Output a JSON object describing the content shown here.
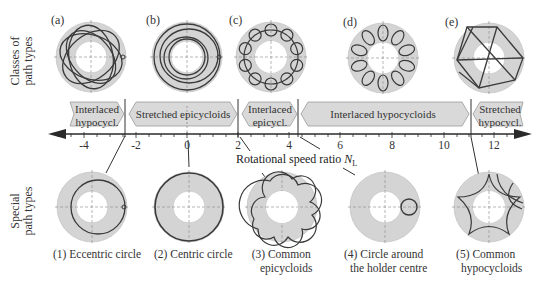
{
  "row_labels": {
    "classes": "Classes of\npath types",
    "classes_line1": "Classes of",
    "classes_line2": "path types",
    "special_line1": "Special",
    "special_line2": "path types"
  },
  "classes": [
    {
      "letter": "(a)",
      "type": "interlaced-hypocycloid"
    },
    {
      "letter": "(b)",
      "type": "stretched-epicycloid"
    },
    {
      "letter": "(c)",
      "type": "interlaced-epicycloid"
    },
    {
      "letter": "(d)",
      "type": "interlaced-hypocycloid"
    },
    {
      "letter": "(e)",
      "type": "stretched-hypocycloid"
    }
  ],
  "regions": [
    {
      "label_line1": "Interlaced",
      "label_line2": "hypocycl.",
      "from": -5.2,
      "to": -2.4
    },
    {
      "label_line1": "Stretched epicycloids",
      "label_line2": "",
      "from": -2.4,
      "to": 2.0
    },
    {
      "label_line1": "Interlaced",
      "label_line2": "epicycl.",
      "from": 2.0,
      "to": 4.3
    },
    {
      "label_line1": "Interlaced hypocycloids",
      "label_line2": "",
      "from": 4.3,
      "to": 11.0
    },
    {
      "label_line1": "Stretched",
      "label_line2": "hypocycl.",
      "from": 11.0,
      "to": 13.2
    }
  ],
  "axis": {
    "title": "Rotational speed ratio ",
    "title_symbol": "N",
    "title_subscript": "L",
    "ticks": [
      "-4",
      "-2",
      "0",
      "2",
      "4",
      "6",
      "8",
      "10",
      "12"
    ],
    "tick_values": [
      -4,
      -2,
      0,
      2,
      4,
      6,
      8,
      10,
      12
    ],
    "range": [
      -5.2,
      13.2
    ],
    "dividers": [
      -2.4,
      2.0,
      4.3,
      11.0
    ]
  },
  "special": [
    {
      "number": "(1)",
      "line1": "(1) Eccentric circle",
      "line2": "",
      "n_value": -2.4
    },
    {
      "number": "(2)",
      "line1": "(2) Centric circle",
      "line2": "",
      "n_value": 0
    },
    {
      "number": "(3)",
      "line1": "(3) Common",
      "line2": "epicycloids",
      "n_value": 2.0
    },
    {
      "number": "(4)",
      "line1": "(4) Circle around",
      "line2": "the holder centre",
      "n_value": 4.3
    },
    {
      "number": "(5)",
      "line1": "(5) Common",
      "line2": "hypocycloids",
      "n_value": 11.0
    }
  ],
  "colors": {
    "annulus_fill": "#d4d4d4",
    "path_stroke": "#3a3a3a",
    "arrow_fill": "#d9d9d9",
    "arrow_stroke": "#9a9a9a",
    "axis": "#2a2a2a"
  }
}
